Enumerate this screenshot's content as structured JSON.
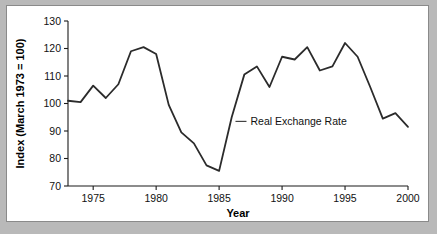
{
  "chart_data": {
    "type": "line",
    "title": "",
    "xlabel": "Year",
    "ylabel": "Index (March 1973 = 100)",
    "xlim": [
      1973,
      2000
    ],
    "ylim": [
      70,
      130
    ],
    "xticks": [
      1975,
      1980,
      1985,
      1990,
      1995,
      2000
    ],
    "xtick_labels": [
      "1975",
      "1980",
      "1985",
      "1990",
      "1995",
      "2000"
    ],
    "yticks": [
      70,
      80,
      90,
      100,
      110,
      120,
      130
    ],
    "ytick_labels": [
      "70",
      "80",
      "90",
      "100",
      "110",
      "120",
      "130"
    ],
    "grid": false,
    "legend": "none",
    "series": [
      {
        "name": "Real Exchange Rate",
        "color": "#2b2b2b",
        "x": [
          1973,
          1974,
          1975,
          1976,
          1977,
          1978,
          1979,
          1980,
          1981,
          1982,
          1983,
          1984,
          1985,
          1986,
          1987,
          1988,
          1989,
          1990,
          1991,
          1992,
          1993,
          1994,
          1995,
          1996,
          1997,
          1998,
          1999,
          2000
        ],
        "values": [
          101,
          100.5,
          106.5,
          102,
          107,
          119,
          120.5,
          118,
          99.5,
          89.5,
          85.5,
          77.5,
          75.5,
          95,
          110.5,
          113.5,
          106,
          117,
          116,
          120.5,
          112,
          113.5,
          122,
          117,
          106,
          94.5,
          96.5,
          91.5
        ]
      }
    ],
    "annotations": [
      {
        "text": "Real Exchange Rate",
        "x": 1986.3,
        "y": 93.5
      }
    ]
  },
  "figure": {
    "background_color": "#ffffff",
    "page_background_color": "#b9b9b9",
    "border_color": "#8a8a8a"
  }
}
